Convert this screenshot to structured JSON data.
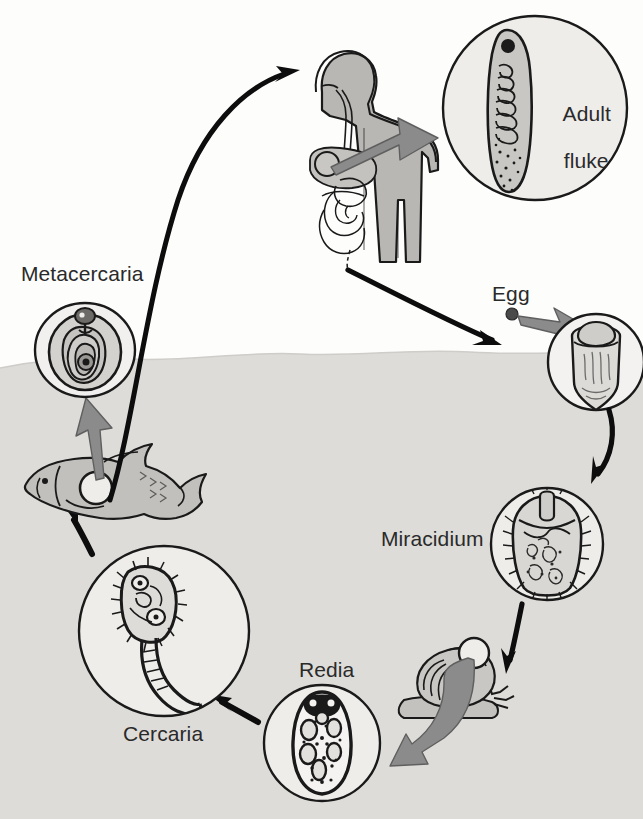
{
  "diagram": {
    "domain_type": "biology-life-cycle-diagram",
    "canvas": {
      "width": 643,
      "height": 819
    },
    "colors": {
      "water_fill": "#dedcd8",
      "body_fill": "#b9b7b3",
      "organism_fill": "#e9e8e5",
      "circle_fill": "#eeedea",
      "outline": "#1a1a1a",
      "gray_arrow": "#8b8b8b",
      "gray_arrow_stroke": "#5f5f5f",
      "label_text": "#2a2a2a",
      "page_background": "#fdfdfc"
    },
    "labels": {
      "metacercaria": "Metacercaria",
      "adult_fluke_line1": "Adult",
      "adult_fluke_line2": "fluke",
      "egg": "Egg",
      "miracidium": "Miracidium",
      "redia": "Redia",
      "cercaria": "Cercaria",
      "top_bleed": ""
    },
    "stages": [
      {
        "id": "adult-fluke",
        "label": "Adult fluke",
        "host": "human",
        "circle": {
          "cx": 535,
          "cy": 108,
          "r": 92
        }
      },
      {
        "id": "egg",
        "label": "Egg",
        "host": "water",
        "circle": {
          "cx": 596,
          "cy": 362,
          "r": 48
        }
      },
      {
        "id": "miracidium",
        "label": "Miracidium",
        "host": "water",
        "circle": {
          "cx": 547,
          "cy": 544,
          "r": 56
        }
      },
      {
        "id": "redia",
        "label": "Redia",
        "host": "snail",
        "circle": {
          "cx": 322,
          "cy": 743,
          "r": 58
        }
      },
      {
        "id": "cercaria",
        "label": "Cercaria",
        "host": "water",
        "circle": {
          "cx": 164,
          "cy": 631,
          "r": 85
        }
      },
      {
        "id": "metacercaria",
        "label": "Metacercaria",
        "host": "fish",
        "circle": {
          "cx": 85,
          "cy": 350,
          "r": 50
        }
      }
    ],
    "hosts": [
      {
        "id": "human",
        "name": "human-definitive-host"
      },
      {
        "id": "snail",
        "name": "snail-intermediate-host"
      },
      {
        "id": "fish",
        "name": "fish-second-intermediate-host"
      }
    ],
    "water": {
      "surface_y": 358,
      "label": "water-surface-line"
    },
    "flow": [
      {
        "from": "human",
        "to": "egg",
        "arrow": "black-curve"
      },
      {
        "from": "egg-dot",
        "to": "egg-circle",
        "arrow": "gray-block"
      },
      {
        "from": "egg-circle",
        "to": "miracidium",
        "arrow": "black-curve"
      },
      {
        "from": "miracidium",
        "to": "snail",
        "arrow": "black-straight"
      },
      {
        "from": "snail",
        "to": "redia",
        "arrow": "gray-block"
      },
      {
        "from": "redia",
        "to": "cercaria",
        "arrow": "black-straight"
      },
      {
        "from": "cercaria",
        "to": "fish",
        "arrow": "black-straight"
      },
      {
        "from": "fish",
        "to": "metacercaria",
        "arrow": "gray-block"
      },
      {
        "from": "fish",
        "to": "human",
        "arrow": "black-curve"
      },
      {
        "from": "human-liver",
        "to": "adult-fluke",
        "arrow": "gray-block"
      }
    ]
  }
}
